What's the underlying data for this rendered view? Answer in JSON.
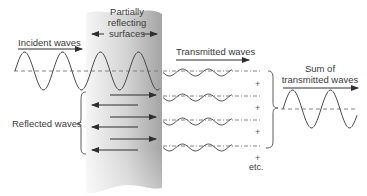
{
  "labels": {
    "incident": "Incident waves",
    "surfaces_line1": "Partially",
    "surfaces_line2": "reflecting",
    "surfaces_line3": "surfaces",
    "transmitted": "Transmitted waves",
    "reflected": "Reflected waves",
    "sum_line1": "Sum of",
    "sum_line2": "transmitted waves",
    "plus": "+",
    "etc": "etc."
  },
  "colors": {
    "line": "#4a4a4a",
    "slab_light": "#f4f4f4",
    "slab_dark": "#a9a9a9",
    "text": "#3a3a3a"
  },
  "elements": {
    "incident_wave": {
      "x_start": 15,
      "x_end": 160,
      "center_y": 71,
      "amplitude": 19,
      "period": 38
    },
    "transmitted_waves_count": 4,
    "transmitted_wave_rows_y": [
      71,
      96,
      120,
      146
    ],
    "reflected_arrows_right_y": [
      95,
      117,
      139
    ],
    "reflected_arrows_left_y": [
      105,
      127,
      150
    ],
    "sum_wave": {
      "x_start": 283,
      "x_end": 357,
      "center_y": 109,
      "amplitude": 19,
      "period": 38
    }
  }
}
